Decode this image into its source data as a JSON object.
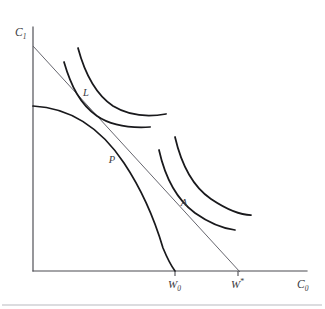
{
  "figure": {
    "background_color": "#ffffff",
    "ink_color": "#19191c",
    "axis_color": "#4a4a50",
    "budget_line_color": "#5e5e66",
    "width": 325,
    "height": 309
  },
  "axes": {
    "y_axis": {
      "label_main": "C",
      "label_sub": "1",
      "label_full": "C1",
      "origin_px": [
        33,
        271
      ],
      "top_px": [
        33,
        27
      ]
    },
    "x_axis": {
      "label_main": "C",
      "label_sub": "0",
      "label_full": "C0",
      "origin_px": [
        33,
        271
      ],
      "right_px": [
        307,
        271
      ]
    }
  },
  "tick_labels": [
    {
      "name": "W0",
      "main": "W",
      "sub": "0",
      "sup": "",
      "x_px": 175,
      "description": "Initial wealth / production frontier x-intercept"
    },
    {
      "name": "Wstar",
      "main": "W",
      "sub": "",
      "sup": "*",
      "x_px": 238,
      "description": "Optimal wealth / market line x-intercept"
    }
  ],
  "point_labels": [
    {
      "name": "L",
      "text": "L",
      "x_px": 86,
      "y_px": 96,
      "description": "Tangency of market line with higher indifference curve"
    },
    {
      "name": "P",
      "text": "P",
      "x_px": 112,
      "y_px": 163,
      "description": "Production optimum on the transformation frontier"
    },
    {
      "name": "A",
      "text": "A",
      "x_px": 184,
      "y_px": 206,
      "description": "Consumption point on lower indifference curve"
    }
  ],
  "curves": {
    "production_frontier": {
      "name": "production-possibility-frontier",
      "kind": "concave-frontier",
      "y_intercept_px": [
        33,
        106
      ],
      "x_intercept_px": [
        175,
        271
      ],
      "path": "M 33 106 C 72 108 102 130 124 163 C 142 190 155 221 163 248 C 168 260 172 267 175 271"
    },
    "market_line": {
      "name": "capital-market-line",
      "kind": "straight-line",
      "start_px": [
        33,
        46
      ],
      "end_px": [
        240,
        272
      ],
      "path": "M 33 46 L 240 272"
    },
    "indifference_curves": [
      {
        "name": "indifference-curve-upper-inner",
        "group": "upper",
        "path": "M 64 62 C 71 86 80 104 97 116 C 113 127 133 128 150 127"
      },
      {
        "name": "indifference-curve-upper-outer",
        "group": "upper",
        "path": "M 78 48 C 85 74 95 94 113 106 C 131 117 149 117 166 114"
      },
      {
        "name": "indifference-curve-lower-inner",
        "group": "lower",
        "path": "M 159 150 C 165 177 176 199 195 213 C 212 225 227 229 235 230"
      },
      {
        "name": "indifference-curve-lower-outer",
        "group": "lower",
        "path": "M 175 137 C 181 163 192 186 211 199 C 229 211 243 215 251 215"
      }
    ]
  },
  "decorations": {
    "bottom_rule": {
      "name": "bottom-horizontal-rule",
      "y_px": 305,
      "x_start_px": 2,
      "x_end_px": 322
    }
  }
}
